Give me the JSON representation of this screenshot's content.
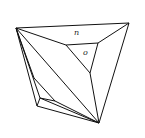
{
  "diagram": {
    "title": "",
    "labels": [
      {
        "text": "n",
        "x": 74,
        "y": 35
      },
      {
        "text": "o",
        "x": 83,
        "y": 55
      }
    ],
    "vertices": {
      "A": [
        16,
        28
      ],
      "B": [
        129,
        23
      ],
      "C": [
        99,
        123
      ],
      "D": [
        66,
        45
      ],
      "E": [
        98,
        43
      ],
      "F": [
        90,
        73
      ],
      "G": [
        34,
        78
      ],
      "H": [
        40,
        98
      ],
      "I": [
        37,
        106
      ],
      "J": [
        55,
        101
      ]
    },
    "stroke_color": "#111111",
    "background": "#ffffff"
  }
}
